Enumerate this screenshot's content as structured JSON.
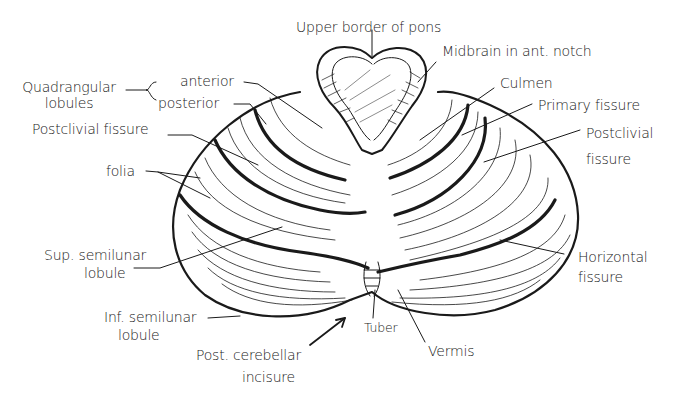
{
  "figure": {
    "colors": {
      "ink": "#1a1a1a",
      "background": "#ffffff"
    }
  },
  "labels": {
    "upper_border_of_pons": "Upper border of pons",
    "midbrain_in_ant_notch": "Midbrain in ant. notch",
    "quadrangular_lobules_line1": "Quadrangular",
    "quadrangular_lobules_line2": "lobules",
    "anterior": "anterior",
    "posterior": "posterior",
    "postclivial_fissure_left": "Postclivial fissure",
    "folia": "folia",
    "culmen": "Culmen",
    "primary_fissure": "Primary fissure",
    "postclivial_fissure_right_line1": "Postclivial",
    "postclivial_fissure_right_line2": "fissure",
    "sup_semilunar_lobule_line1": "Sup. semilunar",
    "sup_semilunar_lobule_line2": "lobule",
    "horizontal_fissure_line1": "Horizontal",
    "horizontal_fissure_line2": "fissure",
    "inf_semilunar_lobule_line1": "Inf. semilunar",
    "inf_semilunar_lobule_line2": "lobule",
    "tuber": "Tuber",
    "vermis": "Vermis",
    "post_cerebellar_incisure_line1": "Post. cerebellar",
    "post_cerebellar_incisure_line2": "incisure"
  }
}
